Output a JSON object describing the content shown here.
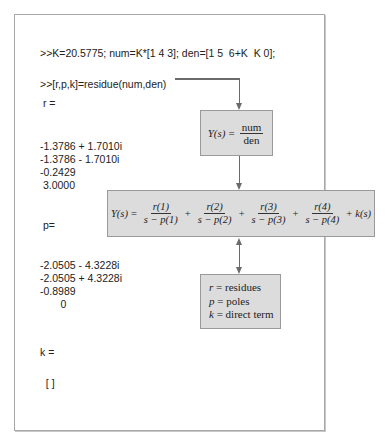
{
  "console": {
    "command_1": ">>K=20.5775; num=K*[1 4 3]; den=[1 5  6+K  K 0];",
    "command_2": ">>[r,p,k]=residue(num,den)",
    "r_label": " r =",
    "r_values": [
      "-1.3786 + 1.7010i",
      "-1.3786 - 1.7010i",
      "-0.2429",
      " 3.0000"
    ],
    "p_label": " p=",
    "p_values": [
      "-2.0505 - 4.3228i",
      "-2.0505 + 4.3228i",
      "-0.8989",
      "       0"
    ],
    "k_label": "k =",
    "k_value": "  [ ]"
  },
  "diagram": {
    "transfer_box": {
      "lhs": "Y(s)",
      "eq": "=",
      "numerator": "num",
      "denominator": "den"
    },
    "expansion_box": {
      "lhs": "Y(s)",
      "eq": "=",
      "terms": [
        {
          "num": "r(1)",
          "den": "s − p(1)"
        },
        {
          "num": "r(2)",
          "den": "s − p(2)"
        },
        {
          "num": "r(3)",
          "den": "s − p(3)"
        },
        {
          "num": "r(4)",
          "den": "s − p(4)"
        }
      ],
      "plus": "+",
      "tail": "k(s)"
    },
    "legend_box": {
      "items": [
        {
          "sym": "r",
          "eq": "=",
          "text": "residues"
        },
        {
          "sym": "p",
          "eq": "=",
          "text": "poles"
        },
        {
          "sym": "k",
          "eq": "=",
          "text": "direct term"
        }
      ]
    },
    "colors": {
      "box_fill": "#dcdcdc",
      "box_border": "#9a9a9a",
      "connector": "#6a6a6a",
      "frame_border": "#a8a8a8"
    }
  }
}
